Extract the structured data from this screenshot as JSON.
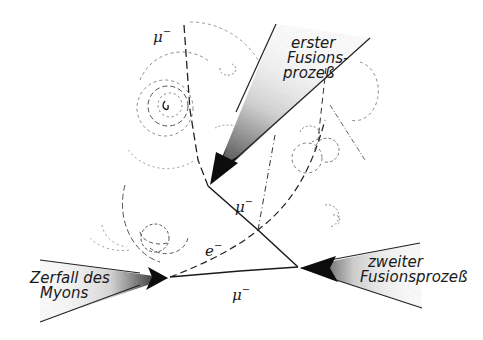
{
  "diagram": {
    "type": "physics-schematic",
    "colors": {
      "ink": "#1a1a1a",
      "background": "#ffffff",
      "stipple": "#9a9a9a"
    },
    "labels": {
      "first_fusion": [
        "erster",
        "Fusions-",
        "prozeß"
      ],
      "second_fusion": [
        "zweiter",
        "Fusionsprozeß"
      ],
      "muon_decay": [
        "Zerfall des",
        "Myons"
      ]
    },
    "particles": {
      "muon_incoming": {
        "symbol": "μ",
        "charge": "−"
      },
      "muon_middle": {
        "symbol": "μ",
        "charge": "−"
      },
      "muon_bottom": {
        "symbol": "μ",
        "charge": "−"
      },
      "electron": {
        "symbol": "e",
        "charge": "−"
      }
    },
    "nodes": [
      {
        "id": "first-fusion-vertex",
        "x": 208,
        "y": 186
      },
      {
        "id": "second-fusion-vertex",
        "x": 298,
        "y": 267
      },
      {
        "id": "decay-vertex",
        "x": 170,
        "y": 277
      }
    ]
  }
}
